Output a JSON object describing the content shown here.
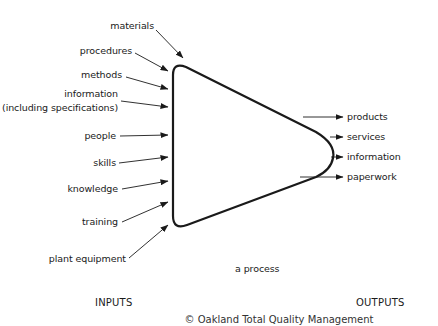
{
  "diagram": {
    "process_label": "a process",
    "inputs_heading": "INPUTS",
    "outputs_heading": "OUTPUTS",
    "inputs": [
      {
        "label": "materials"
      },
      {
        "label": "procedures"
      },
      {
        "label": "methods"
      },
      {
        "label": "information"
      },
      {
        "label": "(including specifications)"
      },
      {
        "label": "people"
      },
      {
        "label": "skills"
      },
      {
        "label": "knowledge"
      },
      {
        "label": "training"
      },
      {
        "label": "plant equipment"
      }
    ],
    "outputs": [
      {
        "label": "products"
      },
      {
        "label": "services"
      },
      {
        "label": "information"
      },
      {
        "label": "paperwork"
      }
    ],
    "caption_clipped": "© Oakland Total Quality Management"
  },
  "colors": {
    "stroke": "#1a1a1a",
    "background": "#ffffff",
    "text": "#1a1a1a"
  }
}
